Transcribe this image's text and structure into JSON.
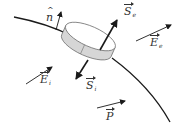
{
  "diagram": {
    "colors": {
      "line": "#1a1a1a",
      "pillbox_fill": "#ffffff",
      "pillbox_side": "#d6d6d6",
      "text": "#333333"
    },
    "labels": {
      "normal": {
        "symbol": "n",
        "mark": "^",
        "sub": ""
      },
      "s_e": {
        "symbol": "S",
        "sub": "e"
      },
      "s_i": {
        "symbol": "S",
        "sub": "i"
      },
      "e_i": {
        "symbol": "E",
        "sub": "i"
      },
      "e_e": {
        "symbol": "E",
        "sub": "e"
      },
      "p": {
        "symbol": "P",
        "sub": ""
      }
    },
    "shapes": {
      "interface_curve": "curve",
      "pillbox": "cylinder"
    }
  }
}
